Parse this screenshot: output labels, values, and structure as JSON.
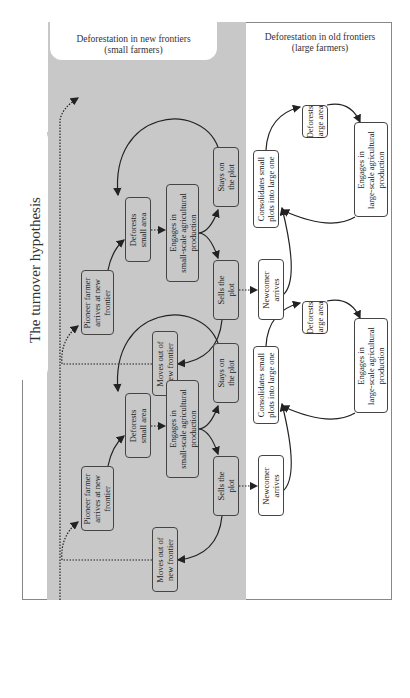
{
  "diagram": {
    "title": "The turnover hypothesis",
    "headers": {
      "new_frontiers": "Deforestation in new frontiers\n(small farmers)",
      "new_frontiers_line1": "Deforestation in new frontiers",
      "new_frontiers_line2": "(small farmers)",
      "old_frontiers_line1": "Deforestation in old frontiers",
      "old_frontiers_line2": "(large farmers)"
    },
    "colors": {
      "new_frontier_bg": "#c8c8c8",
      "old_frontier_bg": "#ffffff",
      "border": "#444444"
    },
    "cycles": [
      {
        "pioneer": "Pioneer farmer\narrives at new\nfrontier",
        "deforests_small": "Deforests\nsmall area",
        "engages_small": "Engages in\nsmall-scale agricultural\nproduction",
        "stays": "Stays on\nthe plot",
        "sells": "Sells the\nplot",
        "moves_out": "Moves out of\nnew frontier",
        "newcomer": "Newcomer\narrives",
        "consolidates": "Consolidates small\nplots into large one",
        "deforests_large": "Deforests\nlarge area",
        "engages_large": "Engages in\nlarge-scale agricultural\nproduction"
      },
      {
        "pioneer": "Pioneer farmer\narrives at new\nfrontier",
        "deforests_small": "Deforests\nsmall area",
        "engages_small": "Engages in\nsmall-scale agricultural\nproduction",
        "stays": "Stays on\nthe plot",
        "sells": "Sells the\nplot",
        "moves_out": "Moves out of\nnew frontier",
        "newcomer": "Newcomer\narrives",
        "consolidates": "Consolidates small\nplots into large one",
        "deforests_large": "Deforests\nlarge area",
        "engages_large": "Engages in\nlarge-scale agricultural\nproduction"
      }
    ]
  }
}
